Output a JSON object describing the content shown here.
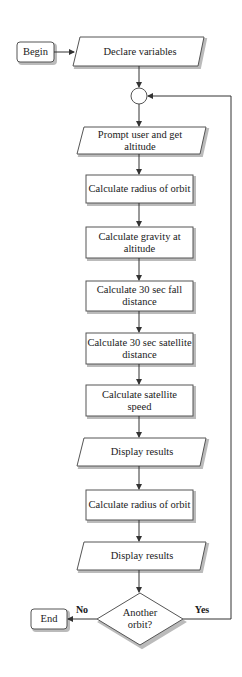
{
  "flowchart": {
    "begin": "Begin",
    "end": "End",
    "nodes": [
      {
        "id": "declare",
        "shape": "parallelogram",
        "label": "Declare variables"
      },
      {
        "id": "prompt",
        "shape": "parallelogram",
        "label": "Prompt user and get altitude"
      },
      {
        "id": "radius1",
        "shape": "rectangle",
        "label": "Calculate radius of orbit"
      },
      {
        "id": "gravity",
        "shape": "rectangle",
        "label": "Calculate gravity at altitude"
      },
      {
        "id": "fall",
        "shape": "rectangle",
        "label": "Calculate 30 sec fall distance"
      },
      {
        "id": "satdist",
        "shape": "rectangle",
        "label": "Calculate 30 sec satellite distance"
      },
      {
        "id": "speed",
        "shape": "rectangle",
        "label": "Calculate satellite speed"
      },
      {
        "id": "display1",
        "shape": "parallelogram",
        "label": "Display results"
      },
      {
        "id": "radius2",
        "shape": "rectangle",
        "label": "Calculate radius of orbit"
      },
      {
        "id": "display2",
        "shape": "parallelogram",
        "label": "Display results"
      }
    ],
    "decision": {
      "label": "Another orbit?",
      "no": "No",
      "yes": "Yes"
    },
    "colors": {
      "stroke": "#555555",
      "fill": "#ffffff",
      "shadow": "#bbbbbb",
      "text": "#1a1a1a"
    }
  }
}
